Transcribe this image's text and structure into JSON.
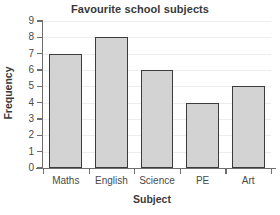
{
  "chart_data": {
    "type": "bar",
    "title": "Favourite school subjects",
    "xlabel": "Subject",
    "ylabel": "Frequency",
    "categories": [
      "Maths",
      "English",
      "Science",
      "PE",
      "Art"
    ],
    "values": [
      7,
      8,
      6,
      4,
      5
    ],
    "ylim": [
      0,
      9
    ],
    "ytick_labels": [
      "0",
      "1",
      "2",
      "3",
      "4",
      "5",
      "6",
      "7",
      "8",
      "9"
    ],
    "ytick_values": [
      0,
      1,
      2,
      3,
      4,
      5,
      6,
      7,
      8,
      9
    ],
    "grid": true,
    "legend": null,
    "bar_fill_color": "#d3d3d3",
    "bar_edge_color": "#3c3c3c",
    "axis_color": "#6e6e6e",
    "grid_color": "#ededed",
    "background_color": "#ffffff",
    "text_color": "#3c3c3c"
  }
}
